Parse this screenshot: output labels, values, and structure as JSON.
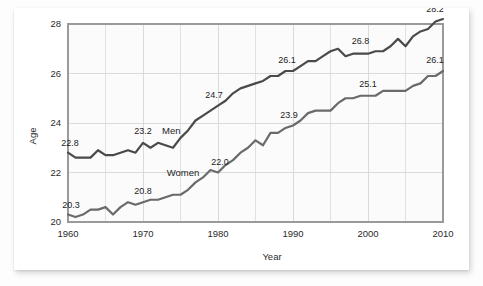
{
  "chart_data": {
    "type": "line",
    "title": "",
    "xlabel": "Year",
    "ylabel": "Age",
    "xlim": [
      1960,
      2010
    ],
    "ylim": [
      20,
      28
    ],
    "xticks": [
      1960,
      1970,
      1980,
      1990,
      2000,
      2010
    ],
    "yticks": [
      20,
      22,
      24,
      26,
      28
    ],
    "grid": true,
    "minor_grid_x_step": 5,
    "legend_position": "inline-labels",
    "x": [
      1960,
      1961,
      1962,
      1963,
      1964,
      1965,
      1966,
      1967,
      1968,
      1969,
      1970,
      1971,
      1972,
      1973,
      1974,
      1975,
      1976,
      1977,
      1978,
      1979,
      1980,
      1981,
      1982,
      1983,
      1984,
      1985,
      1986,
      1987,
      1988,
      1989,
      1990,
      1991,
      1992,
      1993,
      1994,
      1995,
      1996,
      1997,
      1998,
      1999,
      2000,
      2001,
      2002,
      2003,
      2004,
      2005,
      2006,
      2007,
      2008,
      2009,
      2010
    ],
    "series": [
      {
        "name": "Men",
        "color": "#4a4a4a",
        "values": [
          22.8,
          22.6,
          22.6,
          22.6,
          22.9,
          22.7,
          22.7,
          22.8,
          22.9,
          22.8,
          23.2,
          23.0,
          23.2,
          23.1,
          23.0,
          23.4,
          23.7,
          24.1,
          24.3,
          24.5,
          24.7,
          24.9,
          25.2,
          25.4,
          25.5,
          25.6,
          25.7,
          25.9,
          25.9,
          26.1,
          26.1,
          26.3,
          26.5,
          26.5,
          26.7,
          26.9,
          27.0,
          26.7,
          26.8,
          26.8,
          26.8,
          26.9,
          26.9,
          27.1,
          27.4,
          27.1,
          27.5,
          27.7,
          27.8,
          28.1,
          28.2
        ],
        "labeled_points": [
          {
            "x": 1960,
            "y": 22.8,
            "text": "22.8"
          },
          {
            "x": 1970,
            "y": 23.2,
            "text": "23.2"
          },
          {
            "x": 1980,
            "y": 24.7,
            "text": "24.7"
          },
          {
            "x": 1990,
            "y": 26.1,
            "text": "26.1"
          },
          {
            "x": 1999,
            "y": 26.8,
            "text": "26.8"
          },
          {
            "x": 2010,
            "y": 28.2,
            "text": "28.2"
          }
        ]
      },
      {
        "name": "Women",
        "color": "#6a6a6a",
        "values": [
          20.3,
          20.2,
          20.3,
          20.5,
          20.5,
          20.6,
          20.3,
          20.6,
          20.8,
          20.7,
          20.8,
          20.9,
          20.9,
          21.0,
          21.1,
          21.1,
          21.3,
          21.6,
          21.8,
          22.1,
          22.0,
          22.3,
          22.5,
          22.8,
          23.0,
          23.3,
          23.1,
          23.6,
          23.6,
          23.8,
          23.9,
          24.1,
          24.4,
          24.5,
          24.5,
          24.5,
          24.8,
          25.0,
          25.0,
          25.1,
          25.1,
          25.1,
          25.3,
          25.3,
          25.3,
          25.3,
          25.5,
          25.6,
          25.9,
          25.9,
          26.1
        ],
        "labeled_points": [
          {
            "x": 1960,
            "y": 20.3,
            "text": "20.3"
          },
          {
            "x": 1970,
            "y": 20.8,
            "text": "20.8"
          },
          {
            "x": 1980,
            "y": 22.0,
            "text": "22.0"
          },
          {
            "x": 1990,
            "y": 23.9,
            "text": "23.9"
          },
          {
            "x": 2000,
            "y": 25.1,
            "text": "25.1"
          },
          {
            "x": 2010,
            "y": 26.1,
            "text": "26.1"
          }
        ]
      }
    ],
    "colors": {
      "men_line": "#4a4a4a",
      "women_line": "#6a6a6a",
      "grid": "#d6d6d6",
      "axis": "#9a9a9a",
      "plot_background": "#fbfbfb",
      "card_background": "#ffffff",
      "text": "#2b2b2b"
    }
  },
  "axes": {
    "y_label": "Age",
    "x_label": "Year",
    "y_tick_labels": [
      "20",
      "22",
      "24",
      "26",
      "28"
    ],
    "x_tick_labels": [
      "1960",
      "1970",
      "1980",
      "1990",
      "2000",
      "2010"
    ]
  },
  "series_inline_labels": {
    "men": "Men",
    "women": "Women"
  }
}
